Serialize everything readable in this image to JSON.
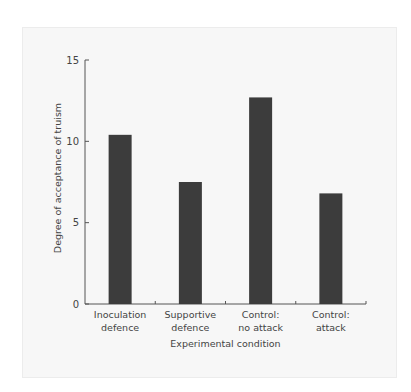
{
  "chart_data": {
    "type": "bar",
    "title": "",
    "xlabel": "Experimental condition",
    "ylabel": "Degree of acceptance of truism",
    "categories": [
      [
        "Inoculation",
        "defence"
      ],
      [
        "Supportive",
        "defence"
      ],
      [
        "Control:",
        "no attack"
      ],
      [
        "Control:",
        "attack"
      ]
    ],
    "category_names": [
      "Inoculation defence",
      "Supportive defence",
      "Control: no attack",
      "Control: attack"
    ],
    "values": [
      10.4,
      7.5,
      12.7,
      6.8
    ],
    "ylim": [
      0,
      15
    ],
    "yticks": [
      0,
      5,
      10,
      15
    ],
    "grid": false,
    "legend": null,
    "bar_color": "#3c3c3c"
  },
  "colors": {
    "panel_background": "#f7f7f7",
    "axis": "#555555",
    "bar": "#3c3c3c"
  }
}
